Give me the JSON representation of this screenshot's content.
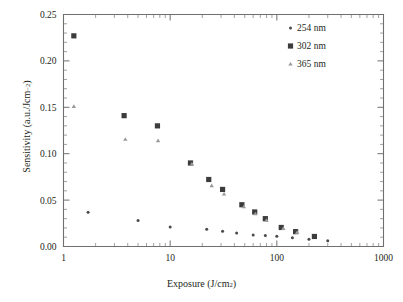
{
  "chart_data": {
    "type": "scatter",
    "title": "",
    "xlabel": "Exposure (J/cm2)",
    "ylabel": "Sensitivity (a.u./Jcm-2)",
    "xscale": "log",
    "yscale": "linear",
    "xlim": [
      1,
      1000
    ],
    "ylim": [
      0.0,
      0.25
    ],
    "grid": false,
    "legend_position": "top-right",
    "xticklabels": [
      "1",
      "10",
      "100",
      "1000"
    ],
    "xtickvalues": [
      1,
      10,
      100,
      1000
    ],
    "yticklabels": [
      "0.00",
      "0.05",
      "0.10",
      "0.15",
      "0.20",
      "0.25"
    ],
    "ytickvalues": [
      0.0,
      0.05,
      0.1,
      0.15,
      0.2,
      0.25
    ],
    "series": [
      {
        "name": "254 nm",
        "marker": "circle",
        "color": "#4a4a4a",
        "size": 3.0,
        "points": [
          [
            1.7,
            0.037
          ],
          [
            5.0,
            0.028
          ],
          [
            10.0,
            0.021
          ],
          [
            22.0,
            0.0185
          ],
          [
            31.0,
            0.0165
          ],
          [
            42.0,
            0.0145
          ],
          [
            60.0,
            0.0125
          ],
          [
            78.0,
            0.0118
          ],
          [
            100.0,
            0.011
          ],
          [
            140.0,
            0.0093
          ],
          [
            200.0,
            0.0078
          ],
          [
            230.0,
            0.0108
          ],
          [
            300.0,
            0.0063
          ]
        ]
      },
      {
        "name": "302 nm",
        "marker": "square",
        "color": "#3c3c3c",
        "size": 5.2,
        "points": [
          [
            1.25,
            0.227
          ],
          [
            3.7,
            0.141
          ],
          [
            7.6,
            0.13
          ],
          [
            15.5,
            0.09
          ],
          [
            23.0,
            0.0722
          ],
          [
            31.0,
            0.0615
          ],
          [
            47.0,
            0.045
          ],
          [
            62.0,
            0.0372
          ],
          [
            78.0,
            0.03
          ],
          [
            110.0,
            0.0205
          ],
          [
            150.0,
            0.016
          ],
          [
            225.0,
            0.0108
          ]
        ]
      },
      {
        "name": "365 nm",
        "marker": "triangle",
        "color": "#9a9a9a",
        "size": 3.6,
        "points": [
          [
            1.25,
            0.151
          ],
          [
            3.8,
            0.1155
          ],
          [
            7.7,
            0.114
          ],
          [
            16.0,
            0.089
          ],
          [
            24.5,
            0.0655
          ],
          [
            32.0,
            0.0565
          ],
          [
            49.0,
            0.0428
          ],
          [
            63.0,
            0.0352
          ],
          [
            80.0,
            0.0282
          ],
          [
            115.0,
            0.0195
          ],
          [
            155.0,
            0.0152
          ]
        ]
      }
    ]
  },
  "legend": {
    "entries": [
      {
        "label": "254 nm"
      },
      {
        "label": "302 nm"
      },
      {
        "label": "365 nm"
      }
    ]
  },
  "axes": {
    "x_title_main": "Exposure (J/cm",
    "x_title_sup": "2",
    "x_title_close": ")",
    "y_title_main": "Sensitivity (a.u./Jcm",
    "y_title_sup": "−2",
    "y_title_close": ")"
  }
}
